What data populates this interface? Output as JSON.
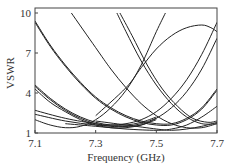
{
  "chart_data": {
    "type": "line",
    "title": "",
    "xlabel": "Frequency (GHz)",
    "ylabel": "VSWR",
    "xlim": [
      7.1,
      7.7
    ],
    "ylim": [
      1,
      10
    ],
    "xticks": [
      7.1,
      7.3,
      7.5,
      7.7
    ],
    "yticks": [
      1,
      4,
      7,
      10
    ],
    "xtick_labels": [
      "7.1",
      "7.3",
      "7.5",
      "7.7"
    ],
    "ytick_labels": [
      "1",
      "4",
      "7",
      "10"
    ],
    "grid": false,
    "legend": null,
    "line_color": "#222222",
    "series": [
      {
        "name": "curve-1",
        "x": [
          7.1,
          7.15,
          7.2,
          7.25,
          7.3,
          7.35,
          7.4,
          7.45,
          7.5,
          7.55,
          7.6,
          7.65,
          7.7
        ],
        "values": [
          9.4,
          7.6,
          6.1,
          4.8,
          3.7,
          2.9,
          2.3,
          1.9,
          1.7,
          1.7,
          2.1,
          2.9,
          4.3
        ]
      },
      {
        "name": "curve-2",
        "x": [
          7.1,
          7.15,
          7.2,
          7.25,
          7.3,
          7.35,
          7.4,
          7.45,
          7.5,
          7.55,
          7.6,
          7.65,
          7.7
        ],
        "values": [
          9.3,
          7.5,
          6.0,
          4.7,
          3.6,
          2.8,
          2.2,
          1.8,
          1.6,
          1.6,
          2.0,
          2.8,
          4.2
        ]
      },
      {
        "name": "curve-3",
        "x": [
          7.1,
          7.15,
          7.2,
          7.25,
          7.3,
          7.35,
          7.4,
          7.45,
          7.5
        ],
        "values": [
          4.6,
          3.6,
          2.8,
          2.2,
          1.8,
          1.6,
          1.6,
          1.8,
          2.2
        ]
      },
      {
        "name": "curve-4",
        "x": [
          7.1,
          7.15,
          7.2,
          7.25,
          7.3,
          7.35,
          7.4,
          7.45,
          7.5
        ],
        "values": [
          4.5,
          3.5,
          2.7,
          2.1,
          1.7,
          1.5,
          1.5,
          1.7,
          2.1
        ]
      },
      {
        "name": "curve-5",
        "x": [
          7.1,
          7.15,
          7.2,
          7.25,
          7.3,
          7.35,
          7.4,
          7.45,
          7.5
        ],
        "values": [
          4.3,
          3.3,
          2.6,
          2.0,
          1.6,
          1.4,
          1.4,
          1.6,
          2.0
        ]
      },
      {
        "name": "curve-6",
        "x": [
          7.22,
          7.3,
          7.35,
          7.4,
          7.45,
          7.5,
          7.55,
          7.6,
          7.65,
          7.7
        ],
        "values": [
          10,
          7.4,
          5.8,
          4.4,
          3.2,
          2.3,
          1.7,
          1.4,
          1.4,
          1.7
        ]
      },
      {
        "name": "curve-7",
        "x": [
          7.37,
          7.4,
          7.45,
          7.5,
          7.55,
          7.6,
          7.65,
          7.7
        ],
        "values": [
          10,
          8.6,
          6.4,
          4.6,
          3.2,
          2.2,
          1.7,
          1.7
        ]
      },
      {
        "name": "curve-8",
        "x": [
          7.38,
          7.42,
          7.47,
          7.52,
          7.57,
          7.62,
          7.67,
          7.7
        ],
        "values": [
          10,
          8.3,
          6.1,
          4.3,
          3.0,
          2.1,
          1.8,
          1.9
        ]
      },
      {
        "name": "curve-9",
        "x": [
          7.1,
          7.15,
          7.2,
          7.25,
          7.3,
          7.35,
          7.4,
          7.45,
          7.5,
          7.53
        ],
        "values": [
          2.0,
          1.6,
          1.4,
          1.5,
          2.0,
          2.9,
          4.2,
          6.1,
          8.6,
          10
        ]
      },
      {
        "name": "curve-10",
        "x": [
          7.1,
          7.2,
          7.3,
          7.35,
          7.4,
          7.45,
          7.5,
          7.55,
          7.6,
          7.65,
          7.7
        ],
        "values": [
          2.7,
          2.1,
          1.7,
          1.6,
          1.7,
          2.0,
          2.6,
          3.6,
          5.0,
          6.9,
          9.3
        ]
      },
      {
        "name": "curve-11",
        "x": [
          7.1,
          7.2,
          7.3,
          7.4,
          7.45,
          7.5,
          7.55,
          7.6,
          7.65,
          7.7
        ],
        "values": [
          2.4,
          1.9,
          1.6,
          1.5,
          1.6,
          2.1,
          2.9,
          4.1,
          5.8,
          8.1
        ]
      },
      {
        "name": "curve-12",
        "x": [
          7.3,
          7.4,
          7.45,
          7.5,
          7.55,
          7.6,
          7.65,
          7.68,
          7.7
        ],
        "values": [
          2.3,
          4.4,
          5.9,
          7.3,
          8.3,
          8.9,
          9.1,
          8.9,
          8.6
        ]
      },
      {
        "name": "curve-13",
        "x": [
          7.2,
          7.3,
          7.4,
          7.5,
          7.55,
          7.6,
          7.65,
          7.7
        ],
        "values": [
          1.7,
          1.5,
          1.3,
          1.2,
          1.3,
          1.6,
          2.2,
          3.0
        ]
      },
      {
        "name": "curve-14",
        "x": [
          7.3,
          7.4,
          7.5,
          7.55,
          7.6,
          7.65,
          7.7
        ],
        "values": [
          1.9,
          1.6,
          1.3,
          1.2,
          1.3,
          1.5,
          1.8
        ]
      }
    ]
  }
}
